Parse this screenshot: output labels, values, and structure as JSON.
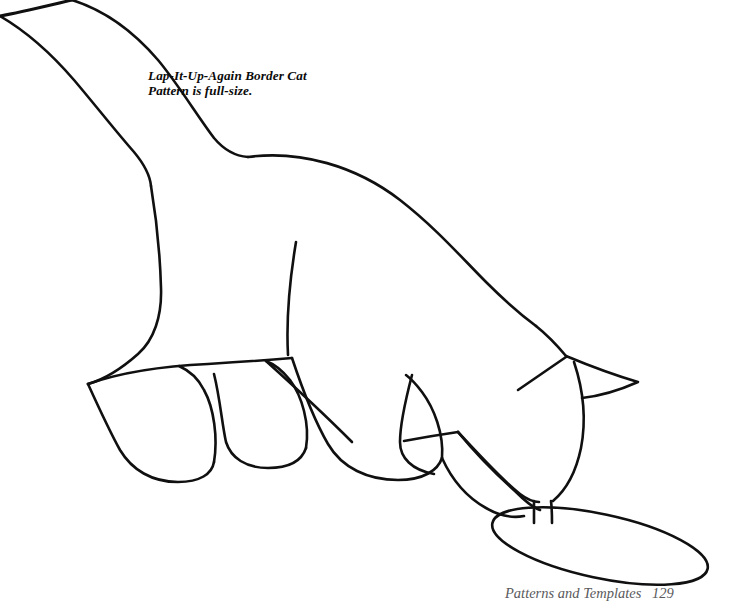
{
  "page": {
    "background_color": "#ffffff",
    "ink_color": "#101010",
    "width": 743,
    "height": 610
  },
  "caption": {
    "line1": "Lap-It-Up-Again Border Cat",
    "line2": "Pattern is full-size."
  },
  "footer": {
    "label": "Patterns and Templates",
    "page_number": "129",
    "color": "#59595c"
  },
  "artwork": {
    "title": "Lap-It-Up-Again Border Cat",
    "type": "line-art-template",
    "subject": "cat drinking from a saucer",
    "stroke_color": "#101010",
    "stroke_width": 2.6,
    "fill": "none",
    "parts": [
      {
        "name": "tail",
        "label": "tail",
        "path": "M 0 16 C 22 12 46 6 72 0"
      },
      {
        "name": "tail-upper-edge",
        "label": "tail upper edge",
        "path": "M 72 0 C 112 14 150 44 176 78 C 196 104 214 134 232 152 C 250 168 272 166 300 160"
      },
      {
        "name": "tail-lower-edge",
        "label": "tail lower edge",
        "path": "M 0 16 C 26 34 56 58 80 86 C 100 110 120 136 136 154 C 146 166 150 176 151 186"
      },
      {
        "name": "back-spine",
        "label": "back and spine",
        "path": "M 232 152 C 300 144 370 176 424 228 C 460 262 480 282 498 296 C 516 310 530 320 548 334"
      },
      {
        "name": "rump-haunch",
        "label": "rump and haunch",
        "path": "M 151 186 C 156 220 160 260 162 296 C 164 322 156 344 140 358 C 120 374 100 382 86 384"
      },
      {
        "name": "hind-leg-rear",
        "label": "rear hind leg",
        "path": "M 86 384 C 96 404 108 430 118 448 C 128 466 146 478 172 480 C 196 482 208 474 210 462"
      },
      {
        "name": "hind-leg-rear-front",
        "label": "rear hind leg front edge",
        "path": "M 210 462 C 214 440 212 410 202 390 C 196 378 186 370 176 366"
      },
      {
        "name": "hind-leg-front",
        "label": "front hind leg",
        "path": "M 212 372 C 218 396 220 424 224 442 C 228 458 244 466 266 466 C 288 466 300 458 304 446"
      },
      {
        "name": "hind-leg-front-edge",
        "label": "front hind leg back edge",
        "path": "M 304 446 C 308 424 300 396 288 380 C 280 370 272 366 264 362"
      },
      {
        "name": "belly-line",
        "label": "belly line",
        "path": "M 86 384 C 120 372 162 366 206 364 C 240 362 268 360 290 358"
      },
      {
        "name": "thigh-diagonal",
        "label": "thigh diagonal fold",
        "path": "M 264 360 C 294 386 324 414 350 440"
      },
      {
        "name": "shoulder-blade",
        "label": "shoulder blade interior line",
        "path": "M 296 242 C 290 278 286 318 288 354"
      },
      {
        "name": "chest-front-leg-rear",
        "label": "chest and rear front leg",
        "path": "M 290 358 C 300 386 312 418 326 442 C 340 466 366 478 396 478 C 422 478 436 468 440 456"
      },
      {
        "name": "front-leg-rear-edge",
        "label": "rear front leg front edge",
        "path": "M 440 456 C 442 434 432 408 420 392 C 414 384 408 378 404 374"
      },
      {
        "name": "front-leg-interior",
        "label": "front leg interior line",
        "path": "M 412 374 C 406 396 400 420 400 440 C 400 456 412 468 432 472"
      },
      {
        "name": "front-paw-forward-top",
        "label": "forward front leg top edge",
        "path": "M 404 440 C 426 436 444 434 458 432"
      },
      {
        "name": "front-paw-forward",
        "label": "forward front paw",
        "path": "M 458 432 C 476 452 498 474 516 492 C 528 504 536 510 540 512"
      },
      {
        "name": "front-paw-forward-lower",
        "label": "forward front paw lower edge",
        "path": "M 440 456 C 450 478 466 496 484 506 C 498 514 512 516 522 514"
      },
      {
        "name": "neck-front",
        "label": "neck front contour",
        "path": "M 548 334 C 562 344 570 352 576 360"
      },
      {
        "name": "ear",
        "label": "ear",
        "path": "M 566 356 C 590 366 614 376 638 382 C 620 390 600 396 582 398"
      },
      {
        "name": "ear-inner-line",
        "label": "ear inner fold line",
        "path": "M 566 357 C 550 368 534 379 518 390"
      },
      {
        "name": "head-cheek",
        "label": "head cheek and jaw",
        "path": "M 572 362 C 582 390 584 420 580 446 C 576 470 566 488 554 500"
      },
      {
        "name": "muzzle-back",
        "label": "muzzle back contour",
        "path": "M 458 432 C 480 456 502 480 520 494 C 528 500 534 502 538 502"
      },
      {
        "name": "muzzle-left",
        "label": "muzzle left side",
        "path": "M 533 500 C 533 508 533 516 533 522"
      },
      {
        "name": "muzzle-right",
        "label": "muzzle right side",
        "path": "M 550 500 C 551 508 551 516 551 522"
      },
      {
        "name": "saucer",
        "label": "saucer / bowl ellipse",
        "cx": 600,
        "cy": 546,
        "rx": 110,
        "ry": 32,
        "rotation": 12
      }
    ]
  }
}
